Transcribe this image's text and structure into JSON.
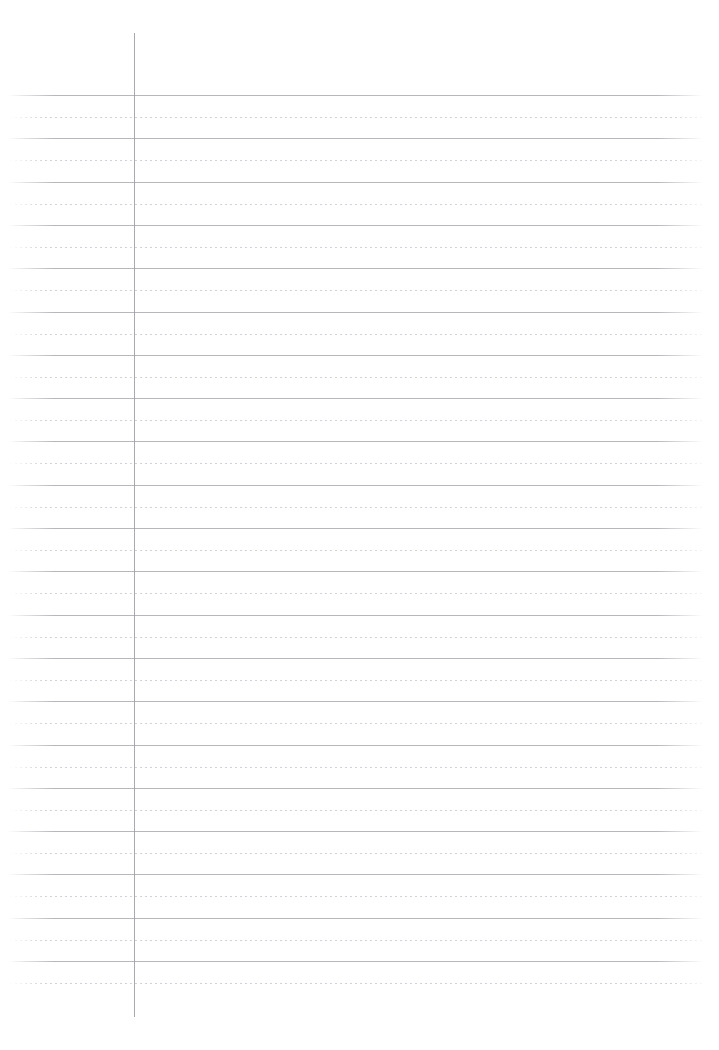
{
  "document": {
    "type": "ruled-notebook-paper",
    "title": "",
    "visible_text": "",
    "page_width": 719,
    "page_height": 1050,
    "background_color": "#ffffff"
  },
  "margin_rule": {
    "name": "vertical-margin-line",
    "x": 134,
    "top": 33,
    "bottom": 1017,
    "color": "#9a9aa2",
    "thickness": 1
  },
  "ruling": {
    "solid_line_color": "#b6b6bd",
    "dotted_line_color": "#cfcfd6",
    "solid_left": 8,
    "solid_right": 703,
    "dotted_left": 10,
    "dotted_right": 707,
    "first_solid_y": 95,
    "line_spacing": 43.3,
    "solid_line_count": 21,
    "dotted_offset": 22,
    "dash_length": 2,
    "dash_gap": 3
  },
  "blemish": {
    "name": "scan-artifact",
    "x": 140,
    "y": 565,
    "width": 38
  }
}
